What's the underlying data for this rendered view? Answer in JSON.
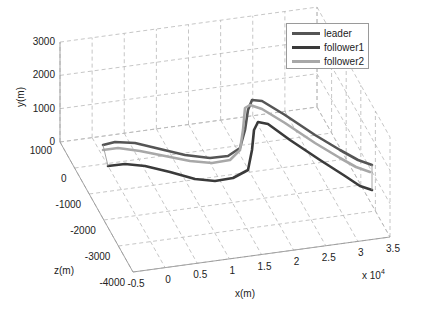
{
  "chart_data": {
    "type": "line",
    "dimensions": "3d",
    "title": "",
    "xlabel": "x(m)",
    "ylabel": "y(m)",
    "zlabel": "z(m)",
    "x_multiplier": "x 10",
    "x_multiplier_exp": "4",
    "x_ticks": [
      "-0.5",
      "0",
      "0.5",
      "1",
      "1.5",
      "2",
      "2.5",
      "3",
      "3.5"
    ],
    "y_ticks": [
      "0",
      "1000",
      "2000",
      "3000"
    ],
    "z_ticks": [
      "1000",
      "0",
      "-1000",
      "-2000",
      "-3000",
      "-4000"
    ],
    "xlim": [
      -5000,
      35000
    ],
    "ylim": [
      0,
      3000
    ],
    "zlim": [
      -4000,
      1000
    ],
    "grid": true,
    "legend_position": "upper right",
    "series": [
      {
        "name": "leader",
        "color": "#555555",
        "screen_path": [
          [
            103,
            145
          ],
          [
            115,
            142
          ],
          [
            135,
            143
          ],
          [
            160,
            149
          ],
          [
            185,
            155
          ],
          [
            210,
            158
          ],
          [
            228,
            156
          ],
          [
            240,
            148
          ],
          [
            245,
            130
          ],
          [
            248,
            110
          ],
          [
            252,
            100
          ],
          [
            262,
            101
          ],
          [
            285,
            115
          ],
          [
            315,
            135
          ],
          [
            340,
            150
          ],
          [
            358,
            160
          ],
          [
            372,
            165
          ]
        ]
      },
      {
        "name": "follower1",
        "color": "#3a3a3a",
        "screen_path": [
          [
            108,
            166
          ],
          [
            125,
            164
          ],
          [
            145,
            166
          ],
          [
            170,
            172
          ],
          [
            195,
            179
          ],
          [
            215,
            181
          ],
          [
            233,
            178
          ],
          [
            248,
            170
          ],
          [
            252,
            150
          ],
          [
            254,
            130
          ],
          [
            258,
            122
          ],
          [
            268,
            124
          ],
          [
            290,
            140
          ],
          [
            320,
            160
          ],
          [
            345,
            176
          ],
          [
            360,
            186
          ],
          [
            372,
            190
          ]
        ]
      },
      {
        "name": "follower2",
        "color": "#a8a8a8",
        "screen_path": [
          [
            103,
            150
          ],
          [
            118,
            148
          ],
          [
            140,
            151
          ],
          [
            165,
            156
          ],
          [
            190,
            161
          ],
          [
            212,
            163
          ],
          [
            230,
            160
          ],
          [
            240,
            150
          ],
          [
            243,
            130
          ],
          [
            245,
            108
          ],
          [
            250,
            105
          ],
          [
            262,
            109
          ],
          [
            285,
            123
          ],
          [
            315,
            143
          ],
          [
            340,
            158
          ],
          [
            356,
            167
          ],
          [
            370,
            172
          ]
        ]
      }
    ]
  }
}
